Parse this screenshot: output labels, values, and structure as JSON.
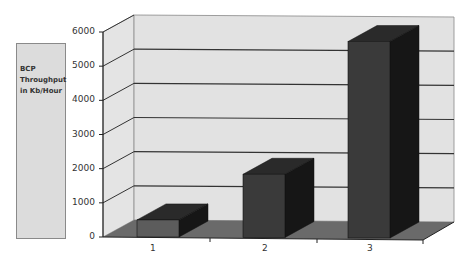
{
  "chart_data": {
    "type": "bar",
    "style": "3d-column",
    "title": "",
    "categories": [
      "1",
      "2",
      "3"
    ],
    "values": [
      500,
      1850,
      5750
    ],
    "series": [
      {
        "name": "BCP Throughput in Kb/Hour",
        "values": [
          500,
          1850,
          5750
        ]
      }
    ],
    "xlabel": "",
    "ylabel": "",
    "ylim": [
      0,
      6000
    ],
    "yticks": [
      "0",
      "1000",
      "2000",
      "3000",
      "4000",
      "5000",
      "6000"
    ],
    "grid": true,
    "legend": {
      "position": "left",
      "entries": [
        "BCP Throughput in Kb/Hour"
      ]
    }
  },
  "legend": {
    "text": "BCP\nThroughput\nin Kb/Hour"
  },
  "colors": {
    "wall": "#e2e2e2",
    "floor": "#6a6a6a",
    "bar_front": "#3a3a3a",
    "bar_front_first": "#5c5c5c",
    "bar_top": "#2a2a2a",
    "bar_side": "#161616",
    "gridline": "#333333",
    "legend_bg": "#dcdcdc"
  }
}
